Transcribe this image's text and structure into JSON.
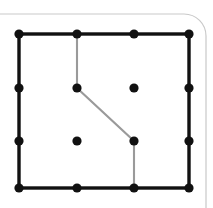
{
  "figure": {
    "canvas": {
      "width": 213,
      "height": 208,
      "background": "#ffffff"
    },
    "colors": {
      "grid_line": "#111111",
      "grid_dot": "#111111",
      "path_line": "#9a9a9a",
      "frame_border": "#c9c9c9",
      "background": "#ffffff"
    },
    "window_frame": {
      "name": "rounded-window-frame",
      "stroke": "#c9c9c9",
      "stroke_width": 1.2,
      "x": -40,
      "y": 14,
      "width": 246,
      "height": 240,
      "corner_radius": 22
    },
    "boundary_rect": {
      "name": "black-boundary-rectangle",
      "left": 19,
      "top": 34,
      "right": 189,
      "bottom": 188,
      "stroke": "#111111",
      "stroke_width": 3.4
    },
    "grid": {
      "x_positions": [
        19,
        77,
        134,
        189
      ],
      "y_positions": [
        34,
        88,
        141,
        188
      ],
      "dot_radius": 4.6,
      "dot_color": "#111111"
    },
    "dots": [
      {
        "id": "dot-tl",
        "label": "top-left corner",
        "x": 19,
        "y": 34
      },
      {
        "id": "dot-t2",
        "label": "top row second",
        "x": 77,
        "y": 34
      },
      {
        "id": "dot-t3",
        "label": "top row third",
        "x": 134,
        "y": 34
      },
      {
        "id": "dot-tr",
        "label": "top-right corner",
        "x": 189,
        "y": 34
      },
      {
        "id": "dot-l2",
        "label": "left edge second",
        "x": 19,
        "y": 88
      },
      {
        "id": "dot-m22",
        "label": "interior bend upper",
        "x": 77,
        "y": 88
      },
      {
        "id": "dot-m23",
        "label": "interior free upper",
        "x": 134,
        "y": 88
      },
      {
        "id": "dot-r2",
        "label": "right edge second",
        "x": 189,
        "y": 88
      },
      {
        "id": "dot-l3",
        "label": "left edge third",
        "x": 19,
        "y": 141
      },
      {
        "id": "dot-m32",
        "label": "interior free lower",
        "x": 77,
        "y": 141
      },
      {
        "id": "dot-m33",
        "label": "interior bend lower",
        "x": 134,
        "y": 141
      },
      {
        "id": "dot-r3",
        "label": "right edge third",
        "x": 189,
        "y": 141
      },
      {
        "id": "dot-bl",
        "label": "bottom-left corner",
        "x": 19,
        "y": 188
      },
      {
        "id": "dot-b2",
        "label": "bottom row second",
        "x": 77,
        "y": 188
      },
      {
        "id": "dot-b3",
        "label": "bottom row third",
        "x": 134,
        "y": 188
      },
      {
        "id": "dot-br",
        "label": "bottom-right corner",
        "x": 189,
        "y": 188
      }
    ],
    "path": {
      "name": "gray-polyline-path",
      "stroke": "#9a9a9a",
      "stroke_width": 2.1,
      "points": "77,34 77,88 134,141 134,188",
      "vertices": [
        {
          "x": 77,
          "y": 34,
          "role": "start-on-top-edge"
        },
        {
          "x": 77,
          "y": 88,
          "role": "bend-upper"
        },
        {
          "x": 134,
          "y": 141,
          "role": "bend-lower"
        },
        {
          "x": 134,
          "y": 188,
          "role": "end-on-bottom-edge"
        }
      ]
    }
  }
}
